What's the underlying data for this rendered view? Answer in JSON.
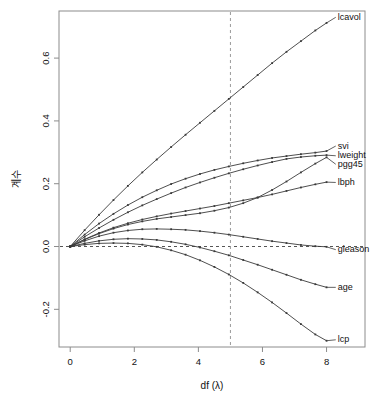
{
  "chart_data": {
    "type": "line",
    "title": "",
    "subtitle": "",
    "xlabel": "df (λ)",
    "ylabel": "계수",
    "xlim": [
      -0.35,
      9.2
    ],
    "ylim": [
      -0.32,
      0.75
    ],
    "xticks": [
      0,
      2,
      4,
      6,
      8
    ],
    "xtick_labels": [
      "0",
      "2",
      "4",
      "6",
      "8"
    ],
    "yticks": [
      -0.2,
      0.0,
      0.2,
      0.4,
      0.6
    ],
    "ytick_labels": [
      "-0.2",
      "0.0",
      "0.2",
      "0.4",
      "0.6"
    ],
    "grid": false,
    "legend_position": "right-inline-labels",
    "annotations": [
      {
        "name": "zero-line",
        "type": "hline",
        "y": 0.0,
        "style": "dashed"
      },
      {
        "name": "selected-df-line",
        "type": "vline",
        "x": 5.0,
        "style": "dashed"
      }
    ],
    "x": [
      0,
      0.45,
      0.9,
      1.35,
      1.8,
      2.25,
      2.7,
      3.15,
      3.6,
      4.05,
      4.5,
      4.95,
      5.4,
      5.85,
      6.3,
      6.75,
      7.2,
      7.65,
      8.0
    ],
    "series": [
      {
        "name": "lcavol",
        "label": "lcavol",
        "values": [
          0.0,
          0.052,
          0.101,
          0.148,
          0.193,
          0.236,
          0.277,
          0.317,
          0.356,
          0.394,
          0.432,
          0.47,
          0.508,
          0.546,
          0.584,
          0.62,
          0.654,
          0.688,
          0.712
        ],
        "label_x": 8.35,
        "label_y": 0.722
      },
      {
        "name": "svi",
        "label": "svi",
        "values": [
          0.0,
          0.038,
          0.073,
          0.104,
          0.132,
          0.157,
          0.179,
          0.199,
          0.216,
          0.231,
          0.244,
          0.255,
          0.265,
          0.274,
          0.282,
          0.288,
          0.294,
          0.299,
          0.304
        ],
        "label_x": 8.35,
        "label_y": 0.312
      },
      {
        "name": "lweight",
        "label": "lweight",
        "values": [
          0.0,
          0.031,
          0.059,
          0.085,
          0.109,
          0.131,
          0.151,
          0.17,
          0.188,
          0.204,
          0.219,
          0.233,
          0.246,
          0.258,
          0.269,
          0.279,
          0.285,
          0.289,
          0.291
        ],
        "label_x": 8.35,
        "label_y": 0.281
      },
      {
        "name": "pgg45",
        "label": "pgg45",
        "values": [
          0.0,
          0.022,
          0.041,
          0.057,
          0.07,
          0.08,
          0.088,
          0.094,
          0.1,
          0.106,
          0.114,
          0.124,
          0.138,
          0.156,
          0.18,
          0.207,
          0.236,
          0.264,
          0.284
        ],
        "label_x": 8.35,
        "label_y": 0.254
      },
      {
        "name": "lbph",
        "label": "lbph",
        "values": [
          0.0,
          0.023,
          0.043,
          0.06,
          0.074,
          0.086,
          0.096,
          0.105,
          0.113,
          0.121,
          0.129,
          0.138,
          0.147,
          0.156,
          0.166,
          0.177,
          0.188,
          0.198,
          0.205
        ],
        "label_x": 8.35,
        "label_y": 0.196
      },
      {
        "name": "gleason",
        "label": "gleason",
        "values": [
          0.0,
          0.018,
          0.033,
          0.044,
          0.051,
          0.055,
          0.056,
          0.055,
          0.053,
          0.049,
          0.044,
          0.038,
          0.031,
          0.024,
          0.017,
          0.011,
          0.005,
          0.001,
          -0.001
        ],
        "label_x": 8.35,
        "label_y": -0.018
      },
      {
        "name": "age",
        "label": "age",
        "values": [
          0.0,
          0.01,
          0.018,
          0.023,
          0.025,
          0.024,
          0.021,
          0.015,
          0.007,
          -0.003,
          -0.015,
          -0.028,
          -0.043,
          -0.058,
          -0.074,
          -0.09,
          -0.106,
          -0.12,
          -0.13
        ],
        "label_x": 8.35,
        "label_y": -0.138
      },
      {
        "name": "lcp",
        "label": "lcp",
        "values": [
          0.0,
          0.006,
          0.01,
          0.011,
          0.01,
          0.006,
          -0.001,
          -0.012,
          -0.026,
          -0.044,
          -0.065,
          -0.089,
          -0.116,
          -0.146,
          -0.178,
          -0.212,
          -0.247,
          -0.28,
          -0.3
        ],
        "label_x": 8.35,
        "label_y": -0.305
      }
    ],
    "colors": {
      "line": "#3a3a3a",
      "axis": "#8c8c8c",
      "dashed": "#555555",
      "text": "#111111",
      "background": "#ffffff"
    }
  }
}
